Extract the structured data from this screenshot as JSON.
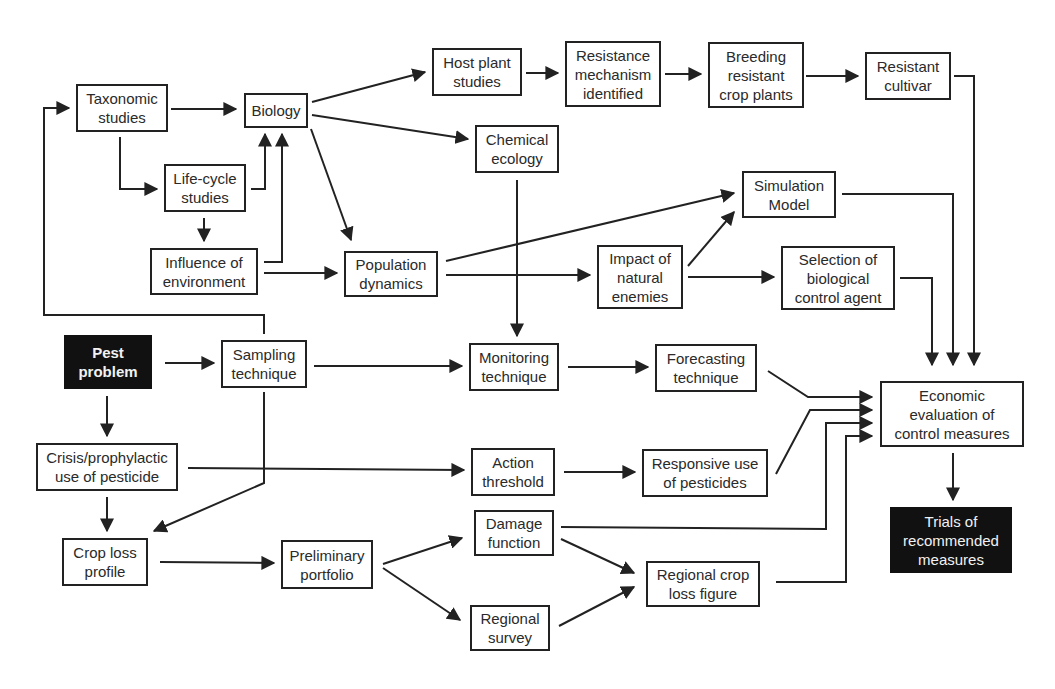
{
  "colors": {
    "line": "#222222",
    "box_border": "#222222",
    "dark_fill": "#111111",
    "dark_text": "#f2f2f2"
  },
  "nodes": [
    {
      "id": "taxonomic",
      "label": "Taxonomic\nstudies",
      "x": 76,
      "y": 84,
      "w": 92,
      "h": 48
    },
    {
      "id": "biology",
      "label": "Biology",
      "x": 244,
      "y": 93,
      "w": 64,
      "h": 35
    },
    {
      "id": "lifecycle",
      "label": "Life-cycle\nstudies",
      "x": 164,
      "y": 164,
      "w": 82,
      "h": 48
    },
    {
      "id": "environment",
      "label": "Influence of\nenvironment",
      "x": 150,
      "y": 248,
      "w": 108,
      "h": 47
    },
    {
      "id": "population",
      "label": "Population\ndynamics",
      "x": 344,
      "y": 251,
      "w": 94,
      "h": 46
    },
    {
      "id": "hostplant",
      "label": "Host plant\nstudies",
      "x": 432,
      "y": 48,
      "w": 90,
      "h": 48
    },
    {
      "id": "resistance",
      "label": "Resistance\nmechanism\nidentified",
      "x": 565,
      "y": 41,
      "w": 96,
      "h": 66
    },
    {
      "id": "breeding",
      "label": "Breeding\nresistant\ncrop plants",
      "x": 708,
      "y": 42,
      "w": 96,
      "h": 66
    },
    {
      "id": "cultivar",
      "label": "Resistant\ncultivar",
      "x": 865,
      "y": 52,
      "w": 86,
      "h": 48
    },
    {
      "id": "chemical",
      "label": "Chemical\necology",
      "x": 475,
      "y": 125,
      "w": 84,
      "h": 48
    },
    {
      "id": "simulation",
      "label": "Simulation\nModel",
      "x": 742,
      "y": 171,
      "w": 94,
      "h": 47
    },
    {
      "id": "natural",
      "label": "Impact of\nnatural\nenemies",
      "x": 597,
      "y": 245,
      "w": 86,
      "h": 64
    },
    {
      "id": "biocontrol",
      "label": "Selection of\nbiological\ncontrol agent",
      "x": 781,
      "y": 246,
      "w": 114,
      "h": 64
    },
    {
      "id": "pest",
      "label": "Pest\nproblem",
      "x": 64,
      "y": 335,
      "w": 88,
      "h": 54,
      "dark": true,
      "bold": true
    },
    {
      "id": "sampling",
      "label": "Sampling\ntechnique",
      "x": 221,
      "y": 340,
      "w": 86,
      "h": 48
    },
    {
      "id": "monitoring",
      "label": "Monitoring\ntechnique",
      "x": 469,
      "y": 343,
      "w": 90,
      "h": 48
    },
    {
      "id": "forecasting",
      "label": "Forecasting\ntechnique",
      "x": 655,
      "y": 344,
      "w": 102,
      "h": 48
    },
    {
      "id": "crisis",
      "label": "Crisis/prophylactic\nuse of pesticide",
      "x": 36,
      "y": 443,
      "w": 142,
      "h": 48
    },
    {
      "id": "action",
      "label": "Action\nthreshold",
      "x": 471,
      "y": 448,
      "w": 84,
      "h": 48
    },
    {
      "id": "responsive",
      "label": "Responsive use\nof pesticides",
      "x": 642,
      "y": 449,
      "w": 126,
      "h": 48
    },
    {
      "id": "economic",
      "label": "Economic\nevaluation of\ncontrol measures",
      "x": 880,
      "y": 381,
      "w": 144,
      "h": 66
    },
    {
      "id": "trials",
      "label": "Trials of\nrecommended\nmeasures",
      "x": 890,
      "y": 507,
      "w": 122,
      "h": 66,
      "dark": true
    },
    {
      "id": "croploss",
      "label": "Crop loss\nprofile",
      "x": 62,
      "y": 538,
      "w": 86,
      "h": 48
    },
    {
      "id": "preliminary",
      "label": "Preliminary\nportfolio",
      "x": 281,
      "y": 540,
      "w": 92,
      "h": 49
    },
    {
      "id": "damage",
      "label": "Damage\nfunction",
      "x": 474,
      "y": 510,
      "w": 80,
      "h": 46
    },
    {
      "id": "regcrop",
      "label": "Regional crop\nloss figure",
      "x": 646,
      "y": 561,
      "w": 114,
      "h": 46
    },
    {
      "id": "survey",
      "label": "Regional\nsurvey",
      "x": 470,
      "y": 605,
      "w": 80,
      "h": 46
    }
  ],
  "edges": [
    {
      "from": "taxonomic",
      "to": "biology",
      "points": [
        [
          171,
          109
        ],
        [
          236,
          109
        ]
      ]
    },
    {
      "from": "taxonomic",
      "to": "lifecycle",
      "points": [
        [
          120,
          137
        ],
        [
          120,
          189
        ],
        [
          157,
          189
        ]
      ]
    },
    {
      "from": "lifecycle",
      "to": "biology",
      "points": [
        [
          251,
          189
        ],
        [
          265,
          189
        ],
        [
          265,
          134
        ]
      ]
    },
    {
      "from": "lifecycle",
      "to": "environment",
      "points": [
        [
          204,
          218
        ],
        [
          204,
          241
        ]
      ]
    },
    {
      "from": "environment",
      "to": "biology",
      "points": [
        [
          264,
          262
        ],
        [
          282,
          262
        ],
        [
          282,
          134
        ]
      ]
    },
    {
      "from": "environment",
      "to": "population",
      "points": [
        [
          264,
          273
        ],
        [
          337,
          273
        ]
      ]
    },
    {
      "from": "biology",
      "to": "hostplant",
      "points": [
        [
          312,
          102
        ],
        [
          425,
          72
        ]
      ]
    },
    {
      "from": "biology",
      "to": "chemical",
      "points": [
        [
          312,
          115
        ],
        [
          468,
          139
        ]
      ]
    },
    {
      "from": "biology",
      "to": "population",
      "points": [
        [
          311,
          129
        ],
        [
          351,
          240
        ]
      ]
    },
    {
      "from": "hostplant",
      "to": "resistance",
      "points": [
        [
          526,
          73
        ],
        [
          558,
          73
        ]
      ]
    },
    {
      "from": "resistance",
      "to": "breeding",
      "points": [
        [
          665,
          74
        ],
        [
          701,
          74
        ]
      ]
    },
    {
      "from": "breeding",
      "to": "cultivar",
      "points": [
        [
          806,
          76
        ],
        [
          858,
          76
        ]
      ]
    },
    {
      "from": "cultivar",
      "to": "economic",
      "points": [
        [
          954,
          76
        ],
        [
          974,
          76
        ],
        [
          974,
          365
        ]
      ]
    },
    {
      "from": "population",
      "to": "simulation",
      "points": [
        [
          446,
          261
        ],
        [
          734,
          193
        ]
      ]
    },
    {
      "from": "population",
      "to": "natural",
      "points": [
        [
          446,
          275
        ],
        [
          590,
          275
        ]
      ]
    },
    {
      "from": "natural",
      "to": "simulation",
      "points": [
        [
          688,
          266
        ],
        [
          734,
          212
        ]
      ]
    },
    {
      "from": "natural",
      "to": "biocontrol",
      "points": [
        [
          688,
          277
        ],
        [
          774,
          277
        ]
      ]
    },
    {
      "from": "simulation",
      "to": "economic",
      "points": [
        [
          842,
          194
        ],
        [
          953,
          194
        ],
        [
          953,
          365
        ]
      ]
    },
    {
      "from": "biocontrol",
      "to": "economic",
      "points": [
        [
          900,
          278
        ],
        [
          932,
          278
        ],
        [
          932,
          365
        ]
      ]
    },
    {
      "from": "chemical",
      "to": "monitoring",
      "points": [
        [
          517,
          180
        ],
        [
          517,
          336
        ]
      ]
    },
    {
      "from": "sampling",
      "to": "taxonomic",
      "points": [
        [
          264,
          334
        ],
        [
          264,
          315
        ],
        [
          44,
          315
        ],
        [
          44,
          108
        ],
        [
          69,
          108
        ]
      ]
    },
    {
      "from": "pest",
      "to": "sampling",
      "points": [
        [
          165,
          363
        ],
        [
          214,
          363
        ]
      ]
    },
    {
      "from": "sampling",
      "to": "monitoring",
      "points": [
        [
          314,
          366
        ],
        [
          462,
          366
        ]
      ]
    },
    {
      "from": "monitoring",
      "to": "forecasting",
      "points": [
        [
          568,
          367
        ],
        [
          648,
          367
        ]
      ]
    },
    {
      "from": "forecasting",
      "to": "economic",
      "points": [
        [
          768,
          371
        ],
        [
          808,
          397
        ],
        [
          872,
          397
        ]
      ]
    },
    {
      "from": "pest",
      "to": "crisis",
      "points": [
        [
          107,
          396
        ],
        [
          107,
          436
        ]
      ]
    },
    {
      "from": "sampling",
      "to": "croploss",
      "points": [
        [
          264,
          392
        ],
        [
          264,
          483
        ],
        [
          154,
          531
        ]
      ]
    },
    {
      "from": "crisis",
      "to": "action",
      "points": [
        [
          188,
          468
        ],
        [
          464,
          470
        ]
      ]
    },
    {
      "from": "action",
      "to": "responsive",
      "points": [
        [
          564,
          472
        ],
        [
          635,
          472
        ]
      ]
    },
    {
      "from": "responsive",
      "to": "economic",
      "points": [
        [
          776,
          474
        ],
        [
          810,
          410
        ],
        [
          872,
          410
        ]
      ]
    },
    {
      "from": "crisis",
      "to": "croploss",
      "points": [
        [
          107,
          497
        ],
        [
          107,
          531
        ]
      ]
    },
    {
      "from": "croploss",
      "to": "preliminary",
      "points": [
        [
          160,
          562
        ],
        [
          274,
          563
        ]
      ]
    },
    {
      "from": "preliminary",
      "to": "damage",
      "points": [
        [
          383,
          564
        ],
        [
          462,
          538
        ]
      ]
    },
    {
      "from": "preliminary",
      "to": "survey",
      "points": [
        [
          383,
          568
        ],
        [
          460,
          620
        ]
      ]
    },
    {
      "from": "damage",
      "to": "economic",
      "points": [
        [
          561,
          527
        ],
        [
          826,
          529
        ],
        [
          826,
          423
        ],
        [
          872,
          423
        ]
      ]
    },
    {
      "from": "damage",
      "to": "regcrop",
      "points": [
        [
          561,
          539
        ],
        [
          634,
          573
        ]
      ]
    },
    {
      "from": "survey",
      "to": "regcrop",
      "points": [
        [
          559,
          626
        ],
        [
          634,
          587
        ]
      ]
    },
    {
      "from": "regcrop",
      "to": "economic",
      "points": [
        [
          776,
          582
        ],
        [
          846,
          582
        ],
        [
          846,
          436
        ],
        [
          872,
          436
        ]
      ]
    },
    {
      "from": "economic",
      "to": "trials",
      "points": [
        [
          953,
          453
        ],
        [
          953,
          500
        ]
      ]
    }
  ]
}
